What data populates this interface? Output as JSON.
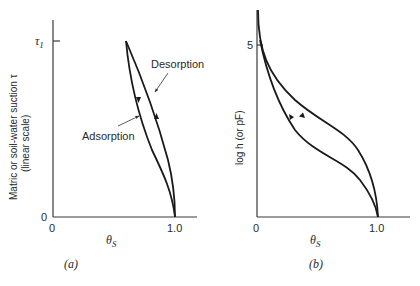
{
  "panels": [
    {
      "id": "a",
      "caption": "(a)",
      "y_axis_label_line1": "Matric or soil-water suction τ",
      "y_axis_label_line2": "(linear scale)",
      "y_ticks": [
        "0",
        "τ1"
      ],
      "x_ticks": [
        "0",
        "1.0"
      ],
      "x_axis_label": "θS",
      "annotations": [
        "Desorption",
        "Adsorption"
      ]
    },
    {
      "id": "b",
      "caption": "(b)",
      "y_axis_label": "log h (or pF)",
      "y_ticks": [
        "5"
      ],
      "x_ticks": [
        "0",
        "1.0"
      ],
      "x_axis_label": "θS"
    }
  ],
  "text": {
    "a_tau": "τ",
    "a_tau_sub": "1",
    "a_zero_y": "0",
    "a_zero_x": "0",
    "a_one_x": "1.0",
    "a_theta": "θ",
    "a_theta_sub": "S",
    "a_caption": "(a)",
    "a_ylabel1": "Matric or soil-water suction τ",
    "a_ylabel2": "(linear scale)",
    "a_desorption": "Desorption",
    "a_adsorption": "Adsorption",
    "b_five": "5",
    "b_zero_x": "0",
    "b_one_x": "1.0",
    "b_theta": "θ",
    "b_theta_sub": "S",
    "b_caption": "(b)",
    "b_ylabel": "log h (or pF)"
  }
}
